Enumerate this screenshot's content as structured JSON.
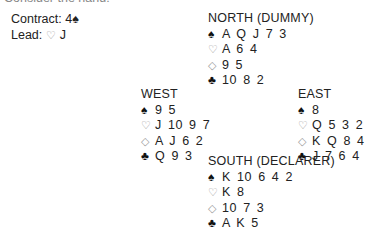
{
  "header_clipped": "Consider the hand:",
  "contract": {
    "label": "Contract:",
    "value": "4",
    "suit_symbol": "♠"
  },
  "lead": {
    "label": "Lead:",
    "suit_symbol": "♡",
    "value": "J"
  },
  "hands": {
    "north": {
      "title": "NORTH (DUMMY)",
      "spades": "A Q J 7 3",
      "hearts": "A 6 4",
      "diamonds": "9 5",
      "clubs": "10 8 2"
    },
    "west": {
      "title": "WEST",
      "spades": "9 5",
      "hearts": "J 10 9 7",
      "diamonds": "A J 6 2",
      "clubs": "Q 9 3"
    },
    "east": {
      "title": "EAST",
      "spades": "8",
      "hearts": "Q 5 3 2",
      "diamonds": "K Q 8 4",
      "clubs": "J 7 6 4"
    },
    "south": {
      "title": "SOUTH (DECLARER)",
      "spades": "K 10 6 4 2",
      "hearts": "K 8",
      "diamonds": "10 7 3",
      "clubs": "A K 5"
    }
  },
  "suit_icons": {
    "spades": "♠",
    "hearts": "♡",
    "diamonds": "◇",
    "clubs": "♣"
  }
}
